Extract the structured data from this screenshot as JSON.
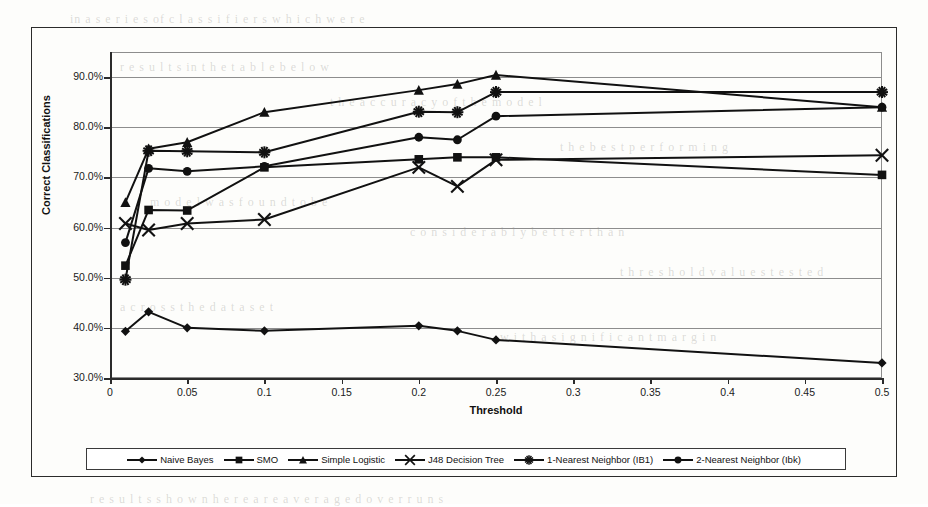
{
  "chart_data": {
    "type": "line",
    "title": "",
    "xlabel": "Threshold",
    "ylabel": "Correct Classifications",
    "xlim": [
      0,
      0.5
    ],
    "ylim": [
      0.3,
      0.95
    ],
    "grid": true,
    "legend_position": "bottom",
    "x_ticks": [
      "0",
      "0.05",
      "0.1",
      "0.15",
      "0.2",
      "0.25",
      "0.3",
      "0.35",
      "0.4",
      "0.45",
      "0.5"
    ],
    "x_tick_values": [
      0,
      0.05,
      0.1,
      0.15,
      0.2,
      0.25,
      0.3,
      0.35,
      0.4,
      0.45,
      0.5
    ],
    "y_ticks": [
      "30.0%",
      "40.0%",
      "50.0%",
      "60.0%",
      "70.0%",
      "80.0%",
      "90.0%"
    ],
    "y_tick_values": [
      0.3,
      0.4,
      0.5,
      0.6,
      0.7,
      0.8,
      0.9
    ],
    "series": [
      {
        "name": "Naive Bayes",
        "marker": "diamond",
        "x": [
          0.01,
          0.025,
          0.05,
          0.1,
          0.2,
          0.225,
          0.25,
          0.5
        ],
        "values": [
          0.393,
          0.432,
          0.4,
          0.394,
          0.404,
          0.394,
          0.376,
          0.33
        ]
      },
      {
        "name": "SMO",
        "marker": "square",
        "x": [
          0.01,
          0.025,
          0.05,
          0.1,
          0.2,
          0.225,
          0.25,
          0.5
        ],
        "values": [
          0.524,
          0.635,
          0.634,
          0.72,
          0.736,
          0.74,
          0.74,
          0.705
        ]
      },
      {
        "name": "Simple Logistic",
        "marker": "triangle",
        "x": [
          0.01,
          0.025,
          0.05,
          0.1,
          0.2,
          0.225,
          0.25,
          0.5
        ],
        "values": [
          0.65,
          0.757,
          0.77,
          0.83,
          0.874,
          0.886,
          0.904,
          0.84
        ]
      },
      {
        "name": "J48 Decision Tree",
        "marker": "x",
        "x": [
          0.01,
          0.025,
          0.05,
          0.1,
          0.2,
          0.225,
          0.25,
          0.5
        ],
        "values": [
          0.608,
          0.595,
          0.608,
          0.616,
          0.72,
          0.682,
          0.735,
          0.744
        ]
      },
      {
        "name": "1-Nearest Neighbor (IB1)",
        "marker": "asterisk",
        "x": [
          0.01,
          0.025,
          0.05,
          0.1,
          0.2,
          0.225,
          0.25,
          0.5
        ],
        "values": [
          0.496,
          0.753,
          0.752,
          0.75,
          0.831,
          0.83,
          0.87,
          0.87
        ]
      },
      {
        "name": "2-Nearest Neighbor (Ibk)",
        "marker": "circle",
        "x": [
          0.01,
          0.025,
          0.05,
          0.1,
          0.2,
          0.225,
          0.25,
          0.5
        ],
        "values": [
          0.57,
          0.718,
          0.712,
          0.722,
          0.78,
          0.775,
          0.822,
          0.84
        ]
      }
    ]
  },
  "colors": {
    "series_color": "#111111",
    "grid_color": "#8d8d8d",
    "axis_color": "#2b2b2b",
    "background": "#fdfdfb"
  },
  "legend": {
    "entries": [
      {
        "label": "Naive Bayes",
        "marker": "diamond"
      },
      {
        "label": "SMO",
        "marker": "square"
      },
      {
        "label": "Simple Logistic",
        "marker": "triangle"
      },
      {
        "label": "J48 Decision Tree",
        "marker": "x"
      },
      {
        "label": "1-Nearest Neighbor (IB1)",
        "marker": "asterisk"
      },
      {
        "label": "2-Nearest Neighbor (Ibk)",
        "marker": "circle"
      }
    ]
  },
  "ghost_text": [
    {
      "text": "in  a  s e r i e s   of   c l a s s i f i e r s   w h i c h   w e r e",
      "x": 70,
      "y": 12,
      "size": 12
    },
    {
      "text": "r e s u l t s   in   t h e   t a b l e   b e l o w",
      "x": 120,
      "y": 60,
      "size": 12
    },
    {
      "text": "t h e   a c c u r a c y   o f   t h e   m o d e l",
      "x": 330,
      "y": 95,
      "size": 12
    },
    {
      "text": "t h e   b e s t   p e r f o r m i n g",
      "x": 560,
      "y": 140,
      "size": 12
    },
    {
      "text": "m o d e l   w a s   f o u n d   t o   b e",
      "x": 150,
      "y": 195,
      "size": 12
    },
    {
      "text": "c o n s i d e r a b l y   b e t t e r   t h a n",
      "x": 410,
      "y": 225,
      "size": 12
    },
    {
      "text": "t h r e s h o l d   v a l u e s   t e s t e d",
      "x": 620,
      "y": 265,
      "size": 12
    },
    {
      "text": "a c r o s s   t h e   d a t a   s e t",
      "x": 120,
      "y": 300,
      "size": 12
    },
    {
      "text": "w i t h   a   s i g n i f i c a n t   m a r g i n",
      "x": 500,
      "y": 330,
      "size": 12
    },
    {
      "text": "r e s u l t s   s h o w n   h e r e   a r e   a v e r a g e d   o v e r   r u n s",
      "x": 90,
      "y": 492,
      "size": 12
    }
  ]
}
